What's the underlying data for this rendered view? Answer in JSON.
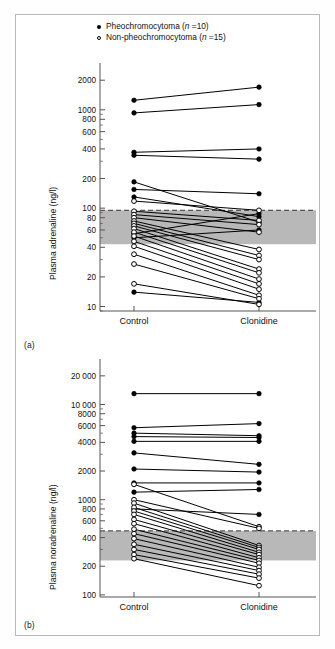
{
  "figure": {
    "panel_a_label": "(a)",
    "panel_b_label": "(b)"
  },
  "legend": {
    "position": "top-center",
    "items": [
      {
        "marker": "filled-circle",
        "text_before": "Pheochromocytoma (",
        "italic": "n",
        "text_after": " =10)",
        "full": "Pheochromocytoma (n =10)",
        "n": 10
      },
      {
        "marker": "open-circle",
        "text_before": "Non-pheochromocytoma (",
        "italic": "n",
        "text_after": " =15)",
        "full": "Non-pheochromocytoma (n =15)",
        "n": 15
      }
    ]
  },
  "colors": {
    "marker_filled": "#000000",
    "marker_open_fill": "#ffffff",
    "line": "#000000",
    "reference_band": "#b8b8b8",
    "reference_band_top_dashed": "#555555",
    "axis": "#555555",
    "frame": "#b9b9b9",
    "background": "#ffffff"
  },
  "chart_data": [
    {
      "id": "panel-a",
      "type": "line",
      "title": "(a)",
      "ylabel": "Plasma adrenaline (ng/l)",
      "xlabel": "",
      "yscale": "log",
      "ylim": [
        9,
        2600
      ],
      "grid": false,
      "categories": [
        "Control",
        "Clonidine"
      ],
      "xticklabels": [
        "Control",
        "Clonidine"
      ],
      "yticks": [
        10,
        20,
        40,
        60,
        80,
        100,
        200,
        400,
        600,
        800,
        1000,
        2000
      ],
      "yticklabels": [
        "10",
        "20",
        "40",
        "60",
        "80",
        "100",
        "200",
        "400",
        "600",
        "800",
        "1000",
        "2000"
      ],
      "reference_band": {
        "low": 43,
        "high": 95,
        "label": "normal reference range",
        "top_line_style": "dashed"
      },
      "series": [
        {
          "name": "Pheochromocytoma",
          "marker": "filled-circle",
          "pairs": [
            {
              "control": 1250,
              "clonidine": 1700
            },
            {
              "control": 930,
              "clonidine": 1130
            },
            {
              "control": 370,
              "clonidine": 400
            },
            {
              "control": 345,
              "clonidine": 315
            },
            {
              "control": 185,
              "clonidine": 72
            },
            {
              "control": 155,
              "clonidine": 140
            },
            {
              "control": 130,
              "clonidine": 82
            },
            {
              "control": 55,
              "clonidine": 88
            },
            {
              "control": 50,
              "clonidine": 60
            },
            {
              "control": 14,
              "clonidine": 11
            }
          ]
        },
        {
          "name": "Non-pheochromocytoma",
          "marker": "open-circle",
          "pairs": [
            {
              "control": 118,
              "clonidine": 95
            },
            {
              "control": 93,
              "clonidine": 75
            },
            {
              "control": 86,
              "clonidine": 68
            },
            {
              "control": 80,
              "clonidine": 57
            },
            {
              "control": 74,
              "clonidine": 38
            },
            {
              "control": 70,
              "clonidine": 33
            },
            {
              "control": 66,
              "clonidine": 30
            },
            {
              "control": 62,
              "clonidine": 24
            },
            {
              "control": 57,
              "clonidine": 22
            },
            {
              "control": 52,
              "clonidine": 19
            },
            {
              "control": 46,
              "clonidine": 17
            },
            {
              "control": 41,
              "clonidine": 15
            },
            {
              "control": 34,
              "clonidine": 13
            },
            {
              "control": 27,
              "clonidine": 12
            },
            {
              "control": 17,
              "clonidine": 10.5
            }
          ]
        }
      ]
    },
    {
      "id": "panel-b",
      "type": "line",
      "title": "(b)",
      "ylabel": "Plasma noradrenaline (ng/l)",
      "xlabel": "",
      "yscale": "log",
      "ylim": [
        95,
        26000
      ],
      "grid": false,
      "categories": [
        "Control",
        "Clonidine"
      ],
      "xticklabels": [
        "Control",
        "Clonidine"
      ],
      "yticks": [
        100,
        200,
        400,
        600,
        800,
        1000,
        2000,
        4000,
        6000,
        8000,
        10000,
        20000
      ],
      "yticklabels": [
        "100",
        "200",
        "400",
        "600",
        "800",
        "1000",
        "2000",
        "4000",
        "6000",
        "8000",
        "10 000",
        "20 000"
      ],
      "reference_band": {
        "low": 230,
        "high": 470,
        "label": "normal reference range",
        "top_line_style": "dashed"
      },
      "series": [
        {
          "name": "Pheochromocytoma",
          "marker": "filled-circle",
          "pairs": [
            {
              "control": 13000,
              "clonidine": 13000
            },
            {
              "control": 5700,
              "clonidine": 6300
            },
            {
              "control": 5000,
              "clonidine": 4700
            },
            {
              "control": 4600,
              "clonidine": 4500
            },
            {
              "control": 4100,
              "clonidine": 4100
            },
            {
              "control": 3100,
              "clonidine": 2350
            },
            {
              "control": 2100,
              "clonidine": 1950
            },
            {
              "control": 1500,
              "clonidine": 1500
            },
            {
              "control": 1200,
              "clonidine": 1280
            },
            {
              "control": 800,
              "clonidine": 700
            }
          ]
        },
        {
          "name": "Non-pheochromocytoma",
          "marker": "open-circle",
          "pairs": [
            {
              "control": 1450,
              "clonidine": 520
            },
            {
              "control": 1000,
              "clonidine": 500
            },
            {
              "control": 920,
              "clonidine": 330
            },
            {
              "control": 830,
              "clonidine": 315
            },
            {
              "control": 760,
              "clonidine": 300
            },
            {
              "control": 700,
              "clonidine": 280
            },
            {
              "control": 620,
              "clonidine": 265
            },
            {
              "control": 560,
              "clonidine": 245
            },
            {
              "control": 490,
              "clonidine": 230
            },
            {
              "control": 440,
              "clonidine": 215
            },
            {
              "control": 390,
              "clonidine": 195
            },
            {
              "control": 340,
              "clonidine": 180
            },
            {
              "control": 300,
              "clonidine": 165
            },
            {
              "control": 265,
              "clonidine": 150
            },
            {
              "control": 240,
              "clonidine": 125
            }
          ]
        }
      ]
    }
  ]
}
